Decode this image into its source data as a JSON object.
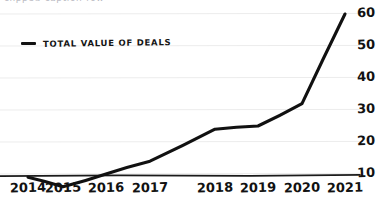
{
  "top_caption": "clipped-caption-row",
  "legend": {
    "marker": "line-dash-marker",
    "label": "TOTAL VALUE OF DEALS"
  },
  "chart_data": {
    "type": "line",
    "title": "",
    "xlabel": "",
    "ylabel": "",
    "categories": [
      "2014",
      "2015",
      "2016",
      "2017",
      "2018",
      "2019",
      "2020",
      "2021"
    ],
    "series": [
      {
        "name": "TOTAL VALUE OF DEALS",
        "color": "#111111",
        "values": [
          9,
          6,
          10,
          14,
          24,
          25,
          32,
          60
        ]
      }
    ],
    "yticks": [
      10,
      20,
      30,
      40,
      50,
      60
    ],
    "ylim": [
      0,
      62
    ],
    "grid": true,
    "grid_color": "#ececec",
    "axis_color": "#1a1a1a",
    "y_axis_position": "right",
    "legend_position": "top-left"
  }
}
